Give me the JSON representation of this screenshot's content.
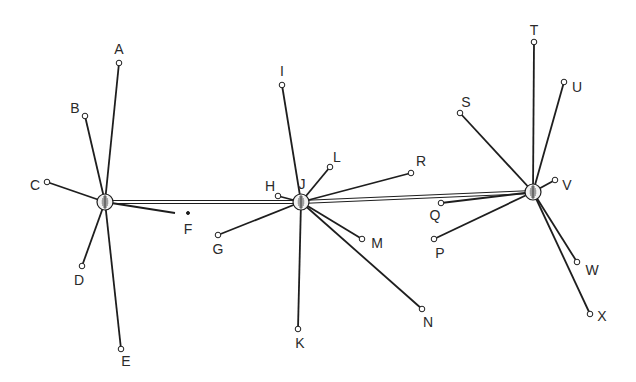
{
  "diagram": {
    "type": "network",
    "colors": {
      "line": "#1e1e1e",
      "hub_fill": "#f2f2f2",
      "node_fill": "#ffffff",
      "label": "#2a2a2a"
    },
    "hubs": [
      {
        "id": "hub-1",
        "x": 105,
        "y": 202
      },
      {
        "id": "hub-2",
        "label": "J",
        "x": 301,
        "y": 202,
        "label_x": 302,
        "label_y": 184
      },
      {
        "id": "hub-3",
        "x": 533,
        "y": 192
      }
    ],
    "trunk_links": [
      {
        "from": "hub-1",
        "to": "hub-2"
      },
      {
        "from": "hub-2",
        "to": "hub-3"
      }
    ],
    "nodes": [
      {
        "label": "A",
        "hub": "hub-1",
        "x": 119,
        "y": 63,
        "lx": 119,
        "ly": 49
      },
      {
        "label": "B",
        "hub": "hub-1",
        "x": 85,
        "y": 116,
        "lx": 75,
        "ly": 108
      },
      {
        "label": "C",
        "hub": "hub-1",
        "x": 47,
        "y": 182,
        "lx": 35,
        "ly": 185
      },
      {
        "label": "D",
        "hub": "hub-1",
        "x": 82,
        "y": 266,
        "lx": 79,
        "ly": 280
      },
      {
        "label": "E",
        "hub": "hub-1",
        "x": 121,
        "y": 349,
        "lx": 126,
        "ly": 361
      },
      {
        "label": "F",
        "hub": "hub-1",
        "x": 188,
        "y": 213,
        "lx": 188,
        "ly": 229,
        "faded": true
      },
      {
        "label": "G",
        "hub": "hub-2",
        "x": 218,
        "y": 235,
        "lx": 218,
        "ly": 249
      },
      {
        "label": "H",
        "hub": "hub-2",
        "x": 278,
        "y": 196,
        "lx": 270,
        "ly": 186
      },
      {
        "label": "I",
        "hub": "hub-2",
        "x": 282,
        "y": 85,
        "lx": 282,
        "ly": 71
      },
      {
        "label": "L",
        "hub": "hub-2",
        "x": 330,
        "y": 167,
        "lx": 337,
        "ly": 157
      },
      {
        "label": "R",
        "hub": "hub-2",
        "x": 411,
        "y": 173,
        "lx": 421,
        "ly": 161
      },
      {
        "label": "M",
        "hub": "hub-2",
        "x": 362,
        "y": 239,
        "lx": 377,
        "ly": 243
      },
      {
        "label": "N",
        "hub": "hub-2",
        "x": 422,
        "y": 309,
        "lx": 428,
        "ly": 322
      },
      {
        "label": "K",
        "hub": "hub-2",
        "x": 298,
        "y": 329,
        "lx": 300,
        "ly": 343
      },
      {
        "label": "Q",
        "hub": "hub-3",
        "x": 441,
        "y": 203,
        "lx": 435,
        "ly": 215
      },
      {
        "label": "P",
        "hub": "hub-3",
        "x": 434,
        "y": 239,
        "lx": 440,
        "ly": 253
      },
      {
        "label": "S",
        "hub": "hub-3",
        "x": 460,
        "y": 113,
        "lx": 466,
        "ly": 102
      },
      {
        "label": "T",
        "hub": "hub-3",
        "x": 534,
        "y": 42,
        "lx": 534,
        "ly": 30
      },
      {
        "label": "U",
        "hub": "hub-3",
        "x": 564,
        "y": 82,
        "lx": 577,
        "ly": 87
      },
      {
        "label": "V",
        "hub": "hub-3",
        "x": 555,
        "y": 180,
        "lx": 567,
        "ly": 185
      },
      {
        "label": "W",
        "hub": "hub-3",
        "x": 577,
        "y": 262,
        "lx": 592,
        "ly": 270
      },
      {
        "label": "X",
        "hub": "hub-3",
        "x": 590,
        "y": 314,
        "lx": 602,
        "ly": 316
      }
    ]
  }
}
